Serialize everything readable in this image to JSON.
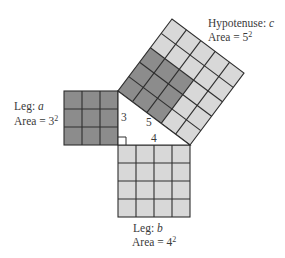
{
  "diagram": {
    "colors": {
      "dark_cell": "#8c8c8c",
      "light_cell": "#d8d8d8",
      "grid_line": "#2e2e2e",
      "background": "#ffffff"
    },
    "triangle": {
      "side_a_label": "3",
      "side_b_label": "4",
      "hypotenuse_label": "5",
      "right_angle_marker": true
    },
    "square_a": {
      "cells_per_side": 3,
      "fill": "dark",
      "label_line1_prefix": "Leg: ",
      "label_line1_var": "a",
      "label_line2_prefix": "Area = 3",
      "label_line2_exp": "2"
    },
    "square_b": {
      "cells_per_side": 4,
      "fill": "light",
      "label_line1_prefix": "Leg: ",
      "label_line1_var": "b",
      "label_line2_prefix": "Area = 4",
      "label_line2_exp": "2"
    },
    "square_c": {
      "cells_per_side": 5,
      "dark_block": "3x3 at leg-a corner",
      "fill": "light",
      "label_line1_prefix": "Hypotenuse: ",
      "label_line1_var": "c",
      "label_line2_prefix": "Area = 5",
      "label_line2_exp": "2"
    }
  }
}
